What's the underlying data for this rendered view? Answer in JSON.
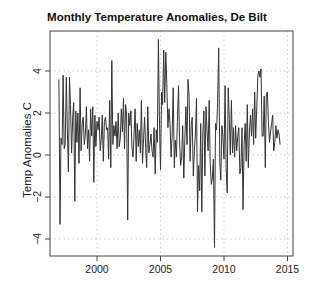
{
  "chart_data": {
    "type": "line",
    "title": "Monthly Temperature Anomalies, De Bilt",
    "xlabel": "",
    "ylabel": "Temp Anomalies C",
    "xlim": [
      1996.3,
      2015.5
    ],
    "ylim": [
      -4.8,
      5.9
    ],
    "x_ticks": [
      2000,
      2005,
      2010,
      2015
    ],
    "y_ticks": [
      -4,
      -2,
      0,
      2,
      4
    ],
    "grid": true,
    "legend": null,
    "x_start": 1997.0,
    "x_step": 0.0833333,
    "series": [
      {
        "name": "Monthly anomaly",
        "values": [
          3.6,
          -3.3,
          0.8,
          0.5,
          3.8,
          0.3,
          0.5,
          3.7,
          1.1,
          -0.8,
          3.7,
          2.4,
          0.1,
          1.8,
          2.5,
          -2.2,
          2.1,
          0.6,
          2.0,
          -0.4,
          3.2,
          0.2,
          1.5,
          1.8,
          0.5,
          1.0,
          2.3,
          0.3,
          1.2,
          -0.3,
          2.2,
          0.9,
          2.3,
          -1.3,
          1.9,
          0.4,
          1.6,
          1.2,
          1.8,
          0.2,
          0.7,
          1.9,
          -0.3,
          1.6,
          1.8,
          1.2,
          1.3,
          -0.2,
          2.6,
          -0.6,
          4.5,
          0.5,
          1.4,
          0.9,
          1.6,
          0.3,
          2.0,
          0.4,
          0.8,
          2.2,
          1.1,
          2.7,
          0.3,
          2.4,
          1.9,
          -3.1,
          2.0,
          1.4,
          2.1,
          0.4,
          -0.1,
          0.9,
          2.2,
          -0.3,
          1.5,
          0.4,
          1.2,
          0.1,
          2.6,
          -0.4,
          0.8,
          1.8,
          0.3,
          -0.6,
          2.3,
          0.1,
          0.5,
          1.0,
          0.2,
          -0.1,
          1.3,
          -0.9,
          1.2,
          0.6,
          5.5,
          1.8,
          -0.7,
          3.0,
          2.4,
          5.0,
          2.5,
          4.9,
          3.4,
          1.3,
          2.2,
          1.5,
          -0.1,
          0.9,
          3.2,
          -0.6,
          0.7,
          -0.1,
          1.6,
          3.3,
          0.8,
          -0.5,
          -0.1,
          1.4,
          -1.1,
          0.7,
          2.3,
          0.5,
          3.6,
          2.8,
          -0.3,
          1.4,
          1.8,
          -1.0,
          0.2,
          1.0,
          2.7,
          -2.7,
          -0.5,
          -1.7,
          1.5,
          -2.7,
          1.0,
          2.1,
          -1.0,
          2.3,
          1.1,
          0.2,
          2.6,
          -0.4,
          -1.4,
          -1.1,
          -0.2,
          -4.4,
          1.5,
          1.2,
          2.5,
          5.1,
          -0.3,
          -1.2,
          1.4,
          0.9,
          -0.2,
          3.3,
          -0.6,
          -1.8,
          3.2,
          1.7,
          0.0,
          2.6,
          0.1,
          1.3,
          -0.1,
          1.4,
          0.2,
          0.9,
          1.3,
          -0.9,
          -0.6,
          1.3,
          -2.6,
          0.5,
          1.5,
          -0.3,
          2.4,
          -0.6,
          1.1,
          1.9,
          0.9,
          2.2,
          0.5,
          3.0,
          0.8,
          2.3,
          3.8,
          4.0,
          3.7,
          4.1,
          0.9,
          0.9,
          2.8,
          -0.6,
          2.9,
          3.0,
          1.6,
          0.6,
          1.1,
          1.5,
          1.9,
          0.2,
          0.6,
          1.4,
          0.8,
          1.2,
          1.0,
          0.5
        ]
      }
    ]
  }
}
